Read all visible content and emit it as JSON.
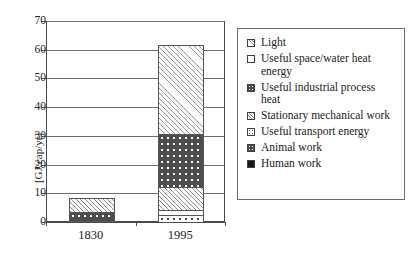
{
  "chart_data": {
    "type": "bar",
    "subtype": "stacked-bar",
    "title": "",
    "xlabel": "",
    "ylabel": "[GJ/cap/yr]",
    "categories": [
      "1830",
      "1995"
    ],
    "ylim": [
      0,
      70
    ],
    "yticks": [
      "0",
      "10",
      "20",
      "30",
      "40",
      "50",
      "60",
      "70"
    ],
    "ytick_values": [
      0,
      10,
      20,
      30,
      40,
      50,
      60,
      70
    ],
    "grid": true,
    "grid_axis": "y",
    "legend_position": "right",
    "series": [
      {
        "name": "Human work",
        "values": [
          0.7,
          0.0
        ],
        "swatch": "sw-solid-dark",
        "fill": "p-solid-dark"
      },
      {
        "name": "Animal work",
        "values": [
          3.2,
          0.0
        ],
        "swatch": "sw-dots-dark",
        "fill": "p-dots-dark"
      },
      {
        "name": "Useful transport energy",
        "values": [
          0.0,
          2.9
        ],
        "swatch": "sw-dots-open",
        "fill": "p-dots-open-sm"
      },
      {
        "name": "Stationary mechanical work",
        "values": [
          4.8,
          1.6
        ],
        "swatch": "sw-hatch-mid",
        "fill": "p-hatch-mid"
      },
      {
        "name": "Useful industrial process heat",
        "values": [
          0.0,
          18.5
        ],
        "swatch": "sw-dots-dark",
        "fill": "p-dots-dark"
      },
      {
        "name": "Useful space/water heat energy",
        "values": [
          0.0,
          8.0
        ],
        "swatch": "sw-white",
        "fill": "p-hatch-mid"
      },
      {
        "name": "Light",
        "values": [
          0.0,
          31.0
        ],
        "swatch": "sw-hatch-light",
        "fill": "p-hatch-light"
      }
    ],
    "totals": [
      8.7,
      62.0
    ],
    "stack_order_bottom_to_top": [
      "Human work",
      "Animal work",
      "Useful transport energy",
      "Stationary mechanical work",
      "Useful industrial process heat",
      "Useful space/water heat energy",
      "Light"
    ],
    "bars": [
      {
        "category": "1830",
        "total": 8.7,
        "segments": [
          {
            "name": "Human work",
            "y0": 0.0,
            "y1": 0.7,
            "fill": "p-solid-dark"
          },
          {
            "name": "Animal work",
            "y0": 0.7,
            "y1": 3.9,
            "fill": "p-dots-dark"
          },
          {
            "name": "Stationary mechanical work",
            "y0": 3.9,
            "y1": 8.7,
            "fill": "p-hatch-mid"
          }
        ]
      },
      {
        "category": "1995",
        "total": 62.0,
        "segments": [
          {
            "name": "Useful transport energy",
            "y0": 0.0,
            "y1": 2.9,
            "fill": "p-dots-open-sm"
          },
          {
            "name": "Stationary mechanical work",
            "y0": 2.9,
            "y1": 4.5,
            "fill": "p-white"
          },
          {
            "name": "Useful space/water heat energy",
            "y0": 4.5,
            "y1": 12.5,
            "fill": "p-hatch-mid"
          },
          {
            "name": "Useful industrial process heat",
            "y0": 12.5,
            "y1": 31.0,
            "fill": "p-dots-dark"
          },
          {
            "name": "Light",
            "y0": 31.0,
            "y1": 62.0,
            "fill": "p-hatch-light"
          }
        ]
      }
    ]
  },
  "legend": {
    "items": [
      {
        "label": "Light",
        "swatch": "sw-hatch-light"
      },
      {
        "label": "Useful space/water heat\nenergy",
        "swatch": "sw-white"
      },
      {
        "label": "Useful industrial process\nheat",
        "swatch": "sw-dots-dark"
      },
      {
        "label": "Stationary mechanical work",
        "swatch": "sw-hatch-mid"
      },
      {
        "label": "Useful transport energy",
        "swatch": "sw-dots-open"
      },
      {
        "label": "Animal work",
        "swatch": "sw-dots-dark"
      },
      {
        "label": "Human work",
        "swatch": "sw-solid-dark"
      }
    ]
  }
}
